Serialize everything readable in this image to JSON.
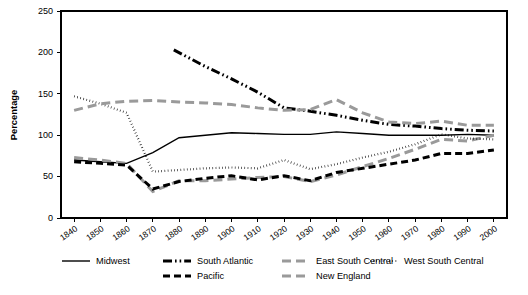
{
  "chart_data": {
    "type": "line",
    "title": "",
    "xlabel": "",
    "ylabel": "Percentage",
    "xlim": [
      1835,
      2005
    ],
    "ylim": [
      0,
      250
    ],
    "ytick_step": 50,
    "grid": false,
    "legend_position": "bottom",
    "x": [
      1840,
      1850,
      1860,
      1870,
      1880,
      1890,
      1900,
      1910,
      1920,
      1930,
      1940,
      1950,
      1960,
      1970,
      1980,
      1990,
      2000
    ],
    "xtick_labels": [
      "1840",
      "1850",
      "1860",
      "1870",
      "1880",
      "1890",
      "1900",
      "1910",
      "1920",
      "1930",
      "1940",
      "1950",
      "1960",
      "1970",
      "1980",
      "1990",
      "2000"
    ],
    "ytick_labels": [
      "0",
      "50",
      "100",
      "150",
      "200",
      "250"
    ],
    "series": [
      {
        "name": "Midwest",
        "style": "solid",
        "color": "#000000",
        "x": [
          1840,
          1850,
          1860,
          1870,
          1880,
          1890,
          1900,
          1910,
          1920,
          1930,
          1940,
          1950,
          1960,
          1970,
          1980,
          1990,
          2000
        ],
        "values": [
          70,
          68,
          66,
          79,
          97,
          100,
          103,
          102,
          101,
          101,
          104,
          102,
          100,
          100,
          100,
          101,
          100
        ]
      },
      {
        "name": "South Atlantic",
        "style": "dash-dot-dot",
        "color": "#000000",
        "x": [
          1878,
          1890,
          1900,
          1910,
          1920,
          1930,
          1940,
          1950,
          1960,
          1970,
          1980,
          1990,
          2000
        ],
        "values": [
          203,
          183,
          168,
          152,
          133,
          129,
          124,
          118,
          113,
          111,
          108,
          106,
          105
        ]
      },
      {
        "name": "East South Central",
        "style": "dashed",
        "color": "#9a9a9a",
        "x": [
          1840,
          1850,
          1860,
          1870,
          1880,
          1890,
          1900,
          1910,
          1920,
          1930,
          1940,
          1950,
          1960,
          1970,
          1980,
          1990,
          2000
        ],
        "values": [
          73,
          70,
          66,
          32,
          45,
          45,
          47,
          49,
          50,
          44,
          52,
          62,
          72,
          83,
          95,
          93,
          100
        ]
      },
      {
        "name": "West South Central",
        "style": "dotted",
        "color": "#000000",
        "x": [
          1840,
          1850,
          1860,
          1870,
          1880,
          1890,
          1900,
          1910,
          1920,
          1930,
          1940,
          1950,
          1960,
          1970,
          1980,
          1990,
          2000
        ],
        "values": [
          147,
          138,
          127,
          56,
          58,
          60,
          61,
          60,
          70,
          59,
          65,
          73,
          80,
          89,
          101,
          96,
          95
        ]
      },
      {
        "name": "Pacific",
        "style": "dashed-heavy",
        "color": "#000000",
        "x": [
          1840,
          1850,
          1860,
          1870,
          1880,
          1890,
          1900,
          1910,
          1920,
          1930,
          1940,
          1950,
          1960,
          1970,
          1980,
          1990,
          2000
        ],
        "values": [
          68,
          66,
          64,
          35,
          44,
          48,
          51,
          46,
          51,
          45,
          55,
          60,
          65,
          70,
          78,
          78,
          82
        ]
      },
      {
        "name": "New England",
        "style": "dashed",
        "color": "#9a9a9a",
        "x": [
          1840,
          1850,
          1860,
          1870,
          1880,
          1890,
          1900,
          1910,
          1920,
          1930,
          1940,
          1950,
          1960,
          1970,
          1980,
          1990,
          2000
        ],
        "values": [
          130,
          138,
          141,
          142,
          140,
          139,
          137,
          133,
          130,
          131,
          143,
          127,
          116,
          114,
          117,
          112,
          112
        ]
      }
    ],
    "legend": [
      {
        "label": "Midwest",
        "style": "solid",
        "color": "#000000",
        "row": 0,
        "col": 0
      },
      {
        "label": "South Atlantic",
        "style": "dash-dot-dot",
        "color": "#000000",
        "row": 0,
        "col": 1
      },
      {
        "label": "East South Central",
        "style": "dashed",
        "color": "#9a9a9a",
        "row": 0,
        "col": 2
      },
      {
        "label": "West South Central",
        "style": "dotted",
        "color": "#000000",
        "row": 0,
        "col": 3
      },
      {
        "label": "Pacific",
        "style": "dashed-heavy",
        "color": "#000000",
        "row": 1,
        "col": 1
      },
      {
        "label": "New England",
        "style": "dashed",
        "color": "#9a9a9a",
        "row": 1,
        "col": 2
      }
    ]
  }
}
